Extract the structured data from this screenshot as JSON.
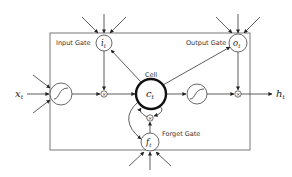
{
  "diagram": {
    "labels": {
      "input_gate": "Input Gate",
      "output_gate": "Output Gate",
      "forget_gate": "Forget Gate",
      "cell": "Cell"
    },
    "symbols": {
      "input_gate": "i",
      "input_gate_sub": "t",
      "output_gate": "o",
      "output_gate_sub": "t",
      "forget_gate": "f",
      "forget_gate_sub": "t",
      "cell": "c",
      "cell_sub": "t",
      "input": "x",
      "input_sub": "t",
      "output": "h",
      "output_sub": "t",
      "multiply": "×"
    },
    "colors": {
      "stroke": "#333333",
      "background": "#ffffff"
    }
  }
}
